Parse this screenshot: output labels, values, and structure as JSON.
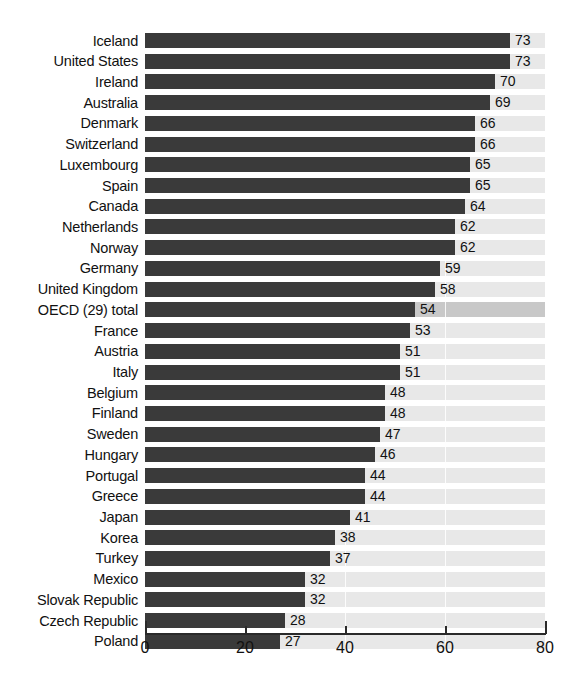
{
  "chart_data": {
    "type": "bar",
    "orientation": "horizontal",
    "title": "",
    "subtitle": "",
    "xlabel": "",
    "ylabel": "",
    "xlim": [
      0,
      80
    ],
    "xticks": [
      "0",
      "20",
      "40",
      "60",
      "80"
    ],
    "xtick_values": [
      0,
      20,
      40,
      60,
      80
    ],
    "grid": "vertical",
    "legend": "none",
    "categories": [
      "Iceland",
      "United States",
      "Ireland",
      "Australia",
      "Denmark",
      "Switzerland",
      "Luxembourg",
      "Spain",
      "Canada",
      "Netherlands",
      "Norway",
      "Germany",
      "United Kingdom",
      "OECD (29) total",
      "France",
      "Austria",
      "Italy",
      "Belgium",
      "Finland",
      "Sweden",
      "Hungary",
      "Portugal",
      "Greece",
      "Japan",
      "Korea",
      "Turkey",
      "Mexico",
      "Slovak Republic",
      "Czech Republic",
      "Poland"
    ],
    "values": [
      73,
      73,
      70,
      69,
      66,
      66,
      65,
      65,
      64,
      62,
      62,
      59,
      58,
      54,
      53,
      51,
      51,
      48,
      48,
      47,
      46,
      44,
      44,
      41,
      38,
      37,
      32,
      32,
      28,
      27
    ],
    "highlight_category": "OECD (29) total",
    "colors": {
      "bar": "#3a3a3a",
      "track": "#e8e8e8",
      "track_highlight": "#c8c8c8",
      "axis": "#2a2a2a",
      "text": "#111111",
      "background": "#ffffff"
    }
  }
}
